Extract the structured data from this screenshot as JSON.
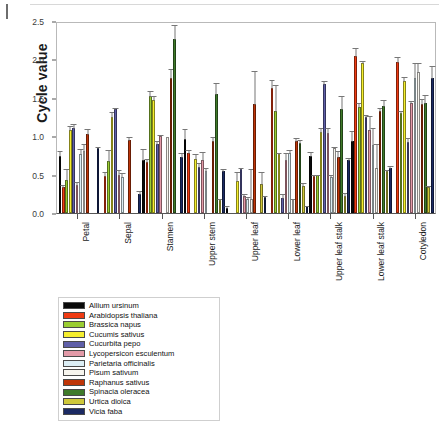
{
  "chart_data": {
    "type": "bar",
    "title": "",
    "xlabel": "",
    "ylabel": "Cycle value",
    "ylim": [
      0.0,
      2.5
    ],
    "yticks": [
      "0.0",
      "0.5",
      "1.0",
      "1.5",
      "2.0",
      "2.5"
    ],
    "ytick_values": [
      0.0,
      0.5,
      1.0,
      1.5,
      2.0,
      2.5
    ],
    "grid": false,
    "legend_position": "below-left",
    "categories": [
      "Petal",
      "Sepal",
      "Stamen",
      "Upper stem",
      "Upper leaf",
      "Lower leaf",
      "Upper leaf stalk",
      "Lower leaf stalk",
      "Cotyledon"
    ],
    "series": [
      {
        "name": "Allium ursinum",
        "color": "#0a0a0a",
        "values": [
          0.76,
          0.0,
          0.7,
          0.98,
          0.07,
          0.0,
          0.75,
          0.95,
          0.0
        ],
        "errors": [
          0.07,
          0.0,
          0.16,
          0.14,
          0.03,
          0.0,
          0.07,
          0.14,
          0.0
        ]
      },
      {
        "name": "Arabidopsis thaliana",
        "color": "#ef3b12",
        "values": [
          0.35,
          0.49,
          0.68,
          0.8,
          0.0,
          1.66,
          0.49,
          2.08,
          2.0
        ],
        "errors": [
          0.03,
          0.06,
          0.05,
          0.05,
          0.0,
          0.11,
          0.03,
          0.12,
          0.07
        ]
      },
      {
        "name": "Brassica napus",
        "color": "#9acd32",
        "values": [
          0.44,
          0.69,
          1.55,
          0.0,
          0.0,
          1.35,
          0.5,
          1.4,
          1.32
        ],
        "errors": [
          0.15,
          0.16,
          0.08,
          0.0,
          0.0,
          0.35,
          0.02,
          0.07,
          0.04
        ]
      },
      {
        "name": "Cucumis sativus",
        "color": "#f5ee2e",
        "values": [
          1.1,
          1.27,
          1.5,
          0.72,
          0.43,
          0.78,
          1.07,
          1.98,
          1.75
        ],
        "errors": [
          0.06,
          0.08,
          0.06,
          0.07,
          0.12,
          0.03,
          0.07,
          0.04,
          0.06
        ]
      },
      {
        "name": "Cucurbita pepo",
        "color": "#5f5fa8",
        "values": [
          1.12,
          1.37,
          0.91,
          0.61,
          0.58,
          0.2,
          1.7,
          1.27,
          0.94
        ],
        "errors": [
          0.07,
          0.03,
          0.06,
          0.06,
          0.03,
          0.06,
          0.06,
          0.04,
          0.06
        ]
      },
      {
        "name": "Lycopersicon esculentum",
        "color": "#e39aa8",
        "values": [
          0.37,
          0.5,
          1.02,
          0.7,
          0.22,
          0.7,
          1.06,
          1.1,
          1.45
        ],
        "errors": [
          0.05,
          0.08,
          0.03,
          0.12,
          0.04,
          0.11,
          0.08,
          0.19,
          0.05
        ]
      },
      {
        "name": "Parietaria officinalis",
        "color": "#dceef5",
        "values": [
          0.78,
          0.47,
          0.0,
          0.55,
          0.19,
          0.8,
          0.47,
          0.9,
          1.78
        ],
        "errors": [
          0.08,
          0.07,
          0.0,
          0.06,
          0.04,
          0.04,
          0.05,
          0.24,
          0.22
        ]
      },
      {
        "name": "Pisum sativum",
        "color": "#f7f5ee",
        "values": [
          0.82,
          0.0,
          1.0,
          0.0,
          0.19,
          0.18,
          0.86,
          0.6,
          1.86
        ],
        "errors": [
          0.1,
          0.0,
          0.0,
          0.0,
          0.4,
          0.02,
          0.02,
          0.32,
          0.14
        ]
      },
      {
        "name": "Raphanus sativus",
        "color": "#bf3508",
        "values": [
          1.05,
          0.97,
          1.79,
          0.95,
          1.44,
          0.95,
          0.74,
          1.35,
          1.44
        ],
        "errors": [
          0.07,
          0.05,
          0.12,
          0.07,
          0.45,
          0.06,
          0.09,
          0.05,
          0.08
        ]
      },
      {
        "name": "Spinacia oleracea",
        "color": "#3f7a2a",
        "values": [
          0.0,
          0.0,
          2.3,
          1.58,
          0.0,
          0.93,
          1.37,
          1.42,
          1.46
        ],
        "errors": [
          0.0,
          0.0,
          0.2,
          0.15,
          0.0,
          0.05,
          0.19,
          0.09,
          0.11
        ]
      },
      {
        "name": "Urtica dioica",
        "color": "#cfc83a",
        "values": [
          0.0,
          0.0,
          0.0,
          0.17,
          0.38,
          0.36,
          0.22,
          0.55,
          0.34
        ],
        "errors": [
          0.0,
          0.0,
          0.0,
          0.03,
          0.17,
          0.05,
          0.06,
          0.03,
          0.03
        ]
      },
      {
        "name": "Vicia faba",
        "color": "#1b2a63",
        "values": [
          0.86,
          0.25,
          0.74,
          0.55,
          0.21,
          0.09,
          0.7,
          0.6,
          1.78
        ],
        "errors": [
          0.02,
          0.05,
          0.06,
          0.04,
          0.03,
          0.02,
          0.04,
          0.03,
          0.17
        ]
      }
    ]
  }
}
